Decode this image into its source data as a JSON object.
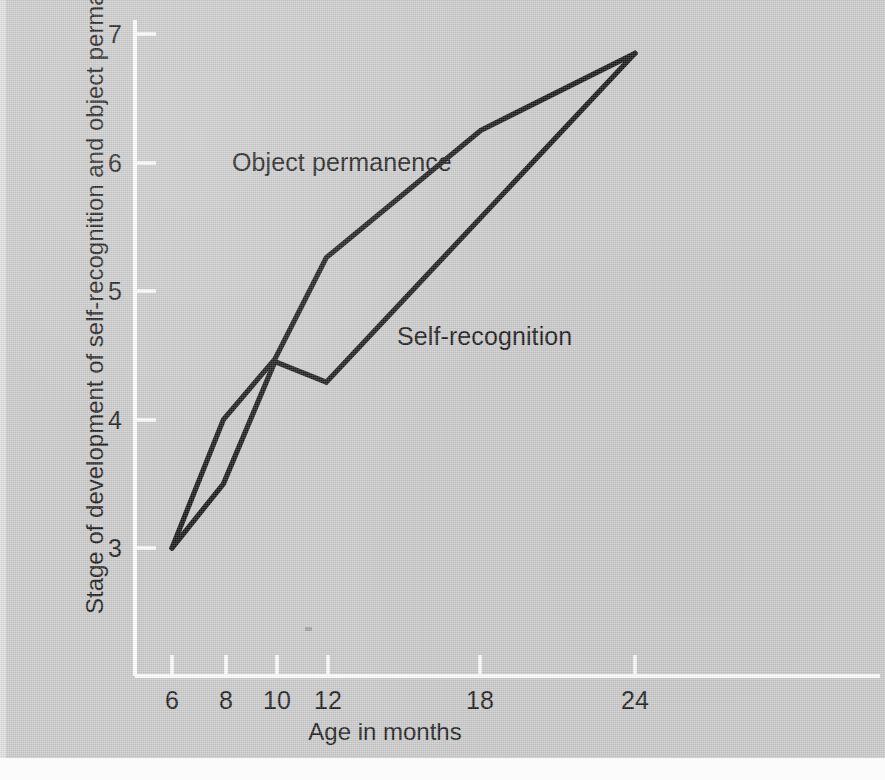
{
  "figure": {
    "background_color": "#c9c9c9",
    "line_color": "#141414",
    "axis_color": "#fdfdfd",
    "text_color": "#1a1a1a"
  },
  "chart_data": {
    "type": "line",
    "title": "",
    "xlabel": "Age in months",
    "ylabel": "Stage of development of self-recognition and object permanence",
    "x": [
      6,
      8,
      10,
      12,
      18,
      24
    ],
    "xtick_labels": [
      "6",
      "8",
      "10",
      "12",
      "18",
      "24"
    ],
    "ytick_labels": [
      "3",
      "4",
      "5",
      "6",
      "7"
    ],
    "xlim": [
      6,
      24
    ],
    "ylim": [
      3,
      7
    ],
    "grid": false,
    "legend": "inline-annotations",
    "series": [
      {
        "name": "Object permanence",
        "x": [
          6,
          8,
          10,
          12,
          18,
          24
        ],
        "values": [
          3.0,
          4.0,
          4.47,
          5.26,
          6.25,
          6.85
        ]
      },
      {
        "name": "Self-recognition",
        "x": [
          6,
          8,
          10,
          12,
          24
        ],
        "values": [
          3.0,
          3.5,
          4.45,
          4.29,
          6.85
        ]
      }
    ],
    "annotations": [
      {
        "text": "Object permanence",
        "series": "Object permanence"
      },
      {
        "text": "Self-recognition",
        "series": "Self-recognition"
      }
    ]
  },
  "axes": {
    "y_ticks": [
      {
        "label": "7"
      },
      {
        "label": "6"
      },
      {
        "label": "5"
      },
      {
        "label": "4"
      },
      {
        "label": "3"
      }
    ],
    "x_ticks": [
      {
        "label": "6"
      },
      {
        "label": "8"
      },
      {
        "label": "10"
      },
      {
        "label": "12"
      },
      {
        "label": "18"
      },
      {
        "label": "24"
      }
    ]
  }
}
